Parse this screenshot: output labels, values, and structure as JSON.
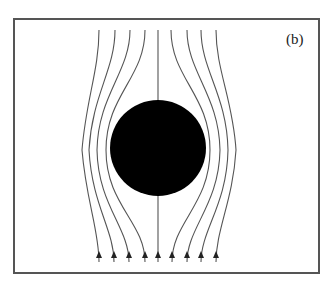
{
  "figure": {
    "panel_label": "(b)",
    "frame_color": "#555555",
    "line_color": "#555555",
    "disk_color": "#000000",
    "streamline_count": 9,
    "flow_direction": "up",
    "disk": {
      "cx": 158,
      "cy": 148,
      "r": 48
    }
  }
}
